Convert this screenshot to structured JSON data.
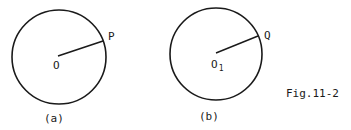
{
  "figure": {
    "caption": "Fig.11-2",
    "panels": [
      {
        "id": "a",
        "label": "(a)",
        "center_label": "O",
        "point_label": "P",
        "circle": {
          "cx": 59,
          "cy": 57,
          "r": 47
        },
        "point": {
          "x": 103,
          "y": 41
        }
      },
      {
        "id": "b",
        "label": "(b)",
        "center_label": "O",
        "center_subscript": "1",
        "point_label": "Q",
        "circle": {
          "cx": 216,
          "cy": 54,
          "r": 46
        },
        "point": {
          "x": 258,
          "y": 36
        }
      }
    ]
  }
}
